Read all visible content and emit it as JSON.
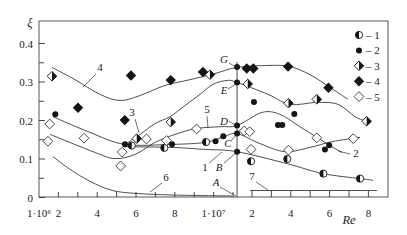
{
  "chart_data": {
    "type": "scatter",
    "title": "",
    "xlabel": "Re",
    "ylabel": "ξ",
    "ylim": [
      0,
      0.45
    ],
    "grid": false,
    "x_scale_note_visible": "axis broken: 1·10⁶ … 1·10⁷ then 2 … 8 (×10⁷)",
    "yticks": [
      {
        "value": 0,
        "label": "0"
      },
      {
        "value": 0.1,
        "label": "0.1"
      },
      {
        "value": 0.2,
        "label": "0.2"
      },
      {
        "value": 0.3,
        "label": "0.3"
      },
      {
        "value": 0.4,
        "label": "0.4"
      }
    ],
    "y_minor_ticks": [
      0.05,
      0.15,
      0.25,
      0.35
    ],
    "xticks": [
      {
        "re_m": 1,
        "label": "1·10⁶"
      },
      {
        "re_m": 2,
        "label": "2"
      },
      {
        "re_m": 4,
        "label": "4"
      },
      {
        "re_m": 6,
        "label": "6"
      },
      {
        "re_m": 8,
        "label": "8"
      },
      {
        "re_m": 10,
        "label": "1·10⁷"
      },
      {
        "re_m": 20,
        "label": "2"
      },
      {
        "re_m": 40,
        "label": "4"
      },
      {
        "re_m": 60,
        "label": "6"
      },
      {
        "re_m": 80,
        "label": "8"
      }
    ],
    "x_minor_ticks_left": [
      2,
      3,
      4,
      5,
      6,
      7,
      8,
      9,
      10,
      11
    ],
    "x_minor_ticks_right": [
      20,
      30,
      40,
      50,
      60,
      70,
      80
    ],
    "legend_position": "top-right",
    "legend": [
      {
        "id": "1",
        "marker": "half-circle",
        "label": "– 1"
      },
      {
        "id": "2",
        "marker": "filled-circle",
        "label": "– 2"
      },
      {
        "id": "3",
        "marker": "half-diamond",
        "label": "– 3"
      },
      {
        "id": "4",
        "marker": "filled-diamond",
        "label": "– 4"
      },
      {
        "id": "5",
        "marker": "open-diamond",
        "label": "– 5"
      }
    ],
    "series": [
      {
        "name": "1",
        "marker": "half-circle",
        "points": [
          [
            5.78,
            0.135
          ],
          [
            7.46,
            0.129
          ],
          [
            9.61,
            0.144
          ],
          [
            19.5,
            0.094
          ],
          [
            38.2,
            0.1
          ],
          [
            56.8,
            0.062
          ],
          [
            75.7,
            0.049
          ]
        ]
      },
      {
        "name": "2",
        "marker": "filled-circle",
        "points": [
          [
            1.84,
            0.216
          ],
          [
            5.43,
            0.138
          ],
          [
            7.86,
            0.138
          ],
          [
            10.1,
            0.146
          ],
          [
            10.5,
            0.159
          ],
          [
            12.3,
            0.339
          ],
          [
            12.3,
            0.299
          ],
          [
            12.3,
            0.187
          ],
          [
            12.3,
            0.166
          ],
          [
            12.3,
            0.119
          ],
          [
            21.0,
            0.248
          ],
          [
            33.4,
            0.188
          ],
          [
            35.6,
            0.188
          ],
          [
            41.8,
            0.217
          ],
          [
            57.6,
            0.125
          ],
          [
            59.8,
            0.136
          ]
        ]
      },
      {
        "name": "3",
        "marker": "half-diamond",
        "points": [
          [
            1.67,
            0.315
          ],
          [
            6.04,
            0.153
          ],
          [
            7.79,
            0.196
          ],
          [
            9.81,
            0.319
          ],
          [
            17.8,
            0.295
          ],
          [
            38.8,
            0.245
          ],
          [
            53.4,
            0.255
          ],
          [
            79.1,
            0.198
          ]
        ]
      },
      {
        "name": "4",
        "marker": "filled-diamond",
        "points": [
          [
            3.01,
            0.233
          ],
          [
            5.42,
            0.201
          ],
          [
            5.74,
            0.317
          ],
          [
            7.79,
            0.305
          ],
          [
            9.45,
            0.326
          ],
          [
            17.3,
            0.335
          ],
          [
            20.7,
            0.335
          ],
          [
            38.6,
            0.34
          ],
          [
            59.4,
            0.285
          ]
        ]
      },
      {
        "name": "5",
        "marker": "open-diamond",
        "points": [
          [
            1.55,
            0.191
          ],
          [
            1.46,
            0.146
          ],
          [
            3.32,
            0.154
          ],
          [
            5.29,
            0.118
          ],
          [
            5.21,
            0.082
          ],
          [
            6.54,
            0.152
          ],
          [
            7.57,
            0.148
          ],
          [
            9.12,
            0.178
          ],
          [
            16.0,
            0.173
          ],
          [
            18.8,
            0.171
          ],
          [
            19.5,
            0.125
          ],
          [
            38.8,
            0.123
          ],
          [
            53.4,
            0.155
          ],
          [
            72.2,
            0.153
          ]
        ]
      }
    ],
    "curves": [
      {
        "label": "4",
        "points": [
          [
            1.67,
            0.338
          ],
          [
            2.86,
            0.306
          ],
          [
            4.14,
            0.268
          ],
          [
            5.18,
            0.252
          ],
          [
            6.21,
            0.265
          ],
          [
            7.49,
            0.291
          ],
          [
            8.78,
            0.306
          ],
          [
            10.07,
            0.322
          ],
          [
            12.3,
            0.338
          ],
          [
            29.3,
            0.343
          ],
          [
            39.6,
            0.34
          ],
          [
            49.9,
            0.319
          ],
          [
            60.2,
            0.286
          ],
          [
            69.5,
            0.255
          ]
        ]
      },
      {
        "label": "3",
        "points": [
          [
            5.43,
            0.138
          ],
          [
            6.21,
            0.164
          ],
          [
            6.98,
            0.192
          ],
          [
            7.75,
            0.21
          ],
          [
            8.53,
            0.239
          ],
          [
            9.3,
            0.268
          ],
          [
            9.97,
            0.294
          ],
          [
            10.69,
            0.304
          ],
          [
            12.3,
            0.299
          ],
          [
            28.2,
            0.268
          ],
          [
            39.6,
            0.242
          ],
          [
            53.5,
            0.247
          ],
          [
            64.3,
            0.242
          ],
          [
            73.1,
            0.21
          ],
          [
            79.3,
            0.197
          ]
        ]
      },
      {
        "label": "2",
        "points": [
          [
            1.72,
            0.21
          ],
          [
            3.63,
            0.169
          ],
          [
            5.43,
            0.138
          ],
          [
            7.86,
            0.138
          ],
          [
            9.56,
            0.143
          ],
          [
            10.54,
            0.158
          ],
          [
            12.3,
            0.166
          ],
          [
            24.1,
            0.14
          ],
          [
            37.0,
            0.119
          ],
          [
            49.9,
            0.13
          ],
          [
            61.2,
            0.145
          ],
          [
            75.7,
            0.156
          ]
        ]
      },
      {
        "label": "5",
        "points": [
          [
            1.57,
            0.164
          ],
          [
            3.89,
            0.117
          ],
          [
            4.92,
            0.101
          ],
          [
            5.95,
            0.112
          ],
          [
            6.98,
            0.143
          ],
          [
            8.01,
            0.164
          ],
          [
            9.09,
            0.179
          ],
          [
            10.33,
            0.184
          ],
          [
            12.3,
            0.187
          ],
          [
            25.2,
            0.221
          ],
          [
            34.4,
            0.216
          ],
          [
            44.7,
            0.184
          ],
          [
            53.5,
            0.156
          ],
          [
            61.2,
            0.132
          ],
          [
            66.4,
            0.117
          ]
        ]
      },
      {
        "label": "1",
        "points": [
          [
            5.43,
            0.132
          ],
          [
            7.86,
            0.13
          ],
          [
            9.56,
            0.125
          ],
          [
            12.3,
            0.119
          ],
          [
            38.0,
            0.088
          ],
          [
            56.6,
            0.062
          ],
          [
            75.7,
            0.049
          ],
          [
            82.4,
            0.045
          ]
        ]
      },
      {
        "label": "6",
        "points": [
          [
            1.72,
            0.106
          ],
          [
            2.6,
            0.073
          ],
          [
            3.63,
            0.042
          ],
          [
            4.81,
            0.018
          ],
          [
            6.21,
            0.01
          ],
          [
            8.27,
            0.006
          ],
          [
            10.95,
            0.004
          ]
        ]
      }
    ],
    "line_7": {
      "label": "7",
      "re_m_from": 19.0,
      "re_m_to": 84.4,
      "xi": 0.018
    },
    "vertical_line": {
      "re_m": 12.3,
      "xi_from": 0,
      "xi_to": 0.352
    },
    "points_on_line": [
      {
        "label": "G",
        "xi": 0.339
      },
      {
        "label": "E",
        "xi": 0.299
      },
      {
        "label": "D",
        "xi": 0.187
      },
      {
        "label": "C",
        "xi": 0.166
      },
      {
        "label": "B",
        "xi": 0.119
      },
      {
        "label": "A",
        "xi": 0.0
      }
    ],
    "annotations": [
      {
        "text": "4",
        "x": 100,
        "y": 71,
        "italic": false,
        "leader": [
          96,
          74,
          83,
          87
        ]
      },
      {
        "text": "3",
        "x": 132,
        "y": 116,
        "italic": false,
        "leader": [
          135,
          119,
          139,
          133
        ]
      },
      {
        "text": "5",
        "x": 207,
        "y": 113,
        "italic": false,
        "leader": [
          207,
          116,
          208,
          128
        ]
      },
      {
        "text": "G",
        "x": 224,
        "y": 63,
        "italic": true,
        "leader": [
          229,
          63,
          236,
          67
        ]
      },
      {
        "text": "E",
        "x": 224,
        "y": 94,
        "italic": true,
        "leader": [
          228,
          89,
          236,
          84
        ]
      },
      {
        "text": "D",
        "x": 224,
        "y": 125,
        "italic": true,
        "leader": [
          229,
          121,
          236,
          126
        ]
      },
      {
        "text": "C",
        "x": 228,
        "y": 147,
        "italic": true,
        "leader": [
          232,
          140,
          236,
          135
        ]
      },
      {
        "text": "1",
        "x": 205,
        "y": 171,
        "italic": false,
        "leader": [
          209,
          163,
          222,
          152
        ]
      },
      {
        "text": "B",
        "x": 219,
        "y": 171,
        "italic": true,
        "leader": [
          224,
          163,
          236,
          153
        ]
      },
      {
        "text": "A",
        "x": 216,
        "y": 186,
        "italic": true,
        "leader": [
          220,
          187,
          236,
          196
        ]
      },
      {
        "text": "6",
        "x": 166,
        "y": 181,
        "italic": false,
        "leader": [
          162,
          183,
          150,
          192
        ]
      },
      {
        "text": "7",
        "x": 252,
        "y": 180,
        "italic": false,
        "leader": [
          256,
          182,
          268,
          190
        ]
      },
      {
        "text": "2",
        "x": 356,
        "y": 157,
        "italic": false,
        "leader": [
          338,
          151,
          350,
          154
        ]
      }
    ]
  }
}
